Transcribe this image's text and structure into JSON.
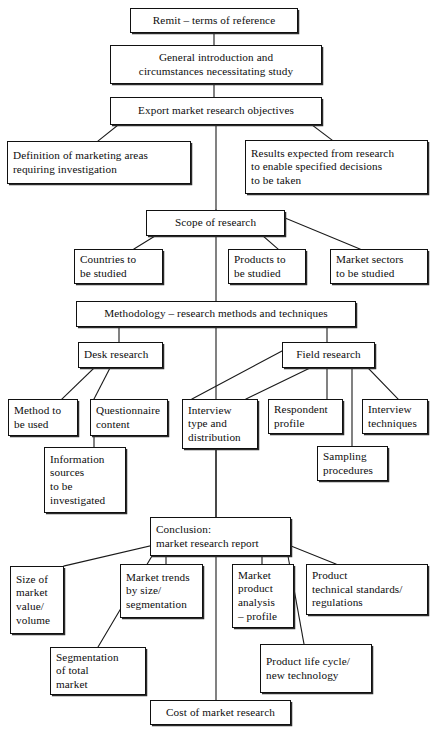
{
  "diagram": {
    "type": "flowchart",
    "orientation": "top-down",
    "line_color": "#111111",
    "box_fill": "#ffffff",
    "nodes": [
      {
        "id": "remit",
        "label": "Remit – terms of reference",
        "x": 130,
        "y": 8,
        "w": 168,
        "h": 25,
        "align": "center"
      },
      {
        "id": "general",
        "label": "General introduction and\ncircumstances necessitating study",
        "x": 110,
        "y": 45,
        "w": 212,
        "h": 39,
        "align": "center"
      },
      {
        "id": "export",
        "label": "Export market research objectives",
        "x": 110,
        "y": 97,
        "w": 212,
        "h": 28,
        "align": "center"
      },
      {
        "id": "definition",
        "label": "Definition of marketing areas\nrequiring investigation",
        "x": 7,
        "y": 141,
        "w": 184,
        "h": 43,
        "align": "left"
      },
      {
        "id": "results",
        "label": "Results expected from research\nto enable specified decisions\nto be taken",
        "x": 245,
        "y": 140,
        "w": 183,
        "h": 54,
        "align": "left"
      },
      {
        "id": "scope",
        "label": "Scope of research",
        "x": 146,
        "y": 210,
        "w": 139,
        "h": 26,
        "align": "center"
      },
      {
        "id": "countries",
        "label": "Countries to\nbe studied",
        "x": 74,
        "y": 249,
        "w": 89,
        "h": 35,
        "align": "left"
      },
      {
        "id": "products",
        "label": "Products to\nbe studied",
        "x": 228,
        "y": 249,
        "w": 78,
        "h": 35,
        "align": "left"
      },
      {
        "id": "marketsectors",
        "label": "Market sectors\nto be studied",
        "x": 330,
        "y": 249,
        "w": 98,
        "h": 35,
        "align": "left"
      },
      {
        "id": "methodology",
        "label": "Methodology – research methods and techniques",
        "x": 76,
        "y": 301,
        "w": 280,
        "h": 26,
        "align": "center"
      },
      {
        "id": "desk",
        "label": "Desk research",
        "x": 78,
        "y": 342,
        "w": 85,
        "h": 26,
        "align": "left"
      },
      {
        "id": "field",
        "label": "Field research",
        "x": 282,
        "y": 342,
        "w": 93,
        "h": 26,
        "align": "center"
      },
      {
        "id": "method",
        "label": "Method to\nbe used",
        "x": 8,
        "y": 399,
        "w": 70,
        "h": 37,
        "align": "left"
      },
      {
        "id": "questionnaire",
        "label": "Questionnaire\ncontent",
        "x": 90,
        "y": 399,
        "w": 78,
        "h": 37,
        "align": "left"
      },
      {
        "id": "interviewtype",
        "label": "Interview\ntype and\ndistribution",
        "x": 182,
        "y": 399,
        "w": 76,
        "h": 50,
        "align": "left"
      },
      {
        "id": "respondent",
        "label": "Respondent\nprofile",
        "x": 268,
        "y": 399,
        "w": 75,
        "h": 35,
        "align": "left"
      },
      {
        "id": "interviewtech",
        "label": "Interview\ntechniques",
        "x": 362,
        "y": 399,
        "w": 66,
        "h": 35,
        "align": "left"
      },
      {
        "id": "information",
        "label": "Information\nsources\nto be\ninvestigated",
        "x": 44,
        "y": 447,
        "w": 82,
        "h": 66,
        "align": "left"
      },
      {
        "id": "sampling",
        "label": "Sampling\nprocedures",
        "x": 317,
        "y": 446,
        "w": 71,
        "h": 35,
        "align": "left"
      },
      {
        "id": "conclusion",
        "label": "Conclusion:\nmarket research report",
        "x": 150,
        "y": 517,
        "w": 141,
        "h": 39,
        "align": "left"
      },
      {
        "id": "sizeofmarket",
        "label": "Size of\nmarket\nvalue/\nvolume",
        "x": 10,
        "y": 566,
        "w": 54,
        "h": 68,
        "align": "left"
      },
      {
        "id": "markettrends",
        "label": "Market trends\nby size/\nsegmentation",
        "x": 120,
        "y": 564,
        "w": 83,
        "h": 54,
        "align": "left"
      },
      {
        "id": "marketproduct",
        "label": "Market\nproduct\nanalysis\n– profile",
        "x": 232,
        "y": 564,
        "w": 62,
        "h": 64,
        "align": "left"
      },
      {
        "id": "producttech",
        "label": "Product\ntechnical standards/\nregulations",
        "x": 306,
        "y": 564,
        "w": 122,
        "h": 51,
        "align": "left"
      },
      {
        "id": "segmentation",
        "label": "Segmentation\nof total\nmarket",
        "x": 50,
        "y": 647,
        "w": 96,
        "h": 48,
        "align": "left"
      },
      {
        "id": "productlife",
        "label": "Product life cycle/\nnew technology",
        "x": 260,
        "y": 644,
        "w": 112,
        "h": 49,
        "align": "left"
      },
      {
        "id": "cost",
        "label": "Cost of market research",
        "x": 150,
        "y": 700,
        "w": 141,
        "h": 25,
        "align": "center"
      }
    ],
    "connectors": [
      {
        "from": "remit",
        "to": "general",
        "path": "M 214 33 L 214 45"
      },
      {
        "from": "general",
        "to": "export",
        "path": "M 214 84 L 214 97"
      },
      {
        "from": "export",
        "to": "definition",
        "path": "M 118 125 L 98 141"
      },
      {
        "from": "export",
        "to": "results",
        "path": "M 312 125 L 332 140"
      },
      {
        "from": "export",
        "to": "spine",
        "path": "M 216 125 L 216 211"
      },
      {
        "from": "spine",
        "to": "scope",
        "path": "M 216 211 L 216 210"
      },
      {
        "from": "scope",
        "to": "countries",
        "path": "M 155 236 L 134 249"
      },
      {
        "from": "scope",
        "to": "products",
        "path": "M 263 236 L 278 249"
      },
      {
        "from": "scope",
        "to": "marketsectors",
        "path": "M 285 218 L 360 249"
      },
      {
        "from": "scope",
        "to": "methodology",
        "path": "M 216 236 L 216 301"
      },
      {
        "from": "methodology",
        "to": "desk",
        "path": "M 119 327 L 119 342"
      },
      {
        "from": "methodology",
        "to": "field",
        "path": "M 327 327 L 327 342"
      },
      {
        "from": "methodology",
        "to": "spine",
        "path": "M 216 327 L 216 518"
      },
      {
        "from": "desk",
        "to": "method",
        "path": "M 94 368 L 62 399"
      },
      {
        "from": "desk",
        "to": "questionnaire",
        "path": "M 110 368 L 94 399"
      },
      {
        "from": "questionnaire",
        "to": "information",
        "path": "M 94 436 L 94 447"
      },
      {
        "from": "field",
        "to": "interviewtype",
        "path": "M 282 351 L 192 399"
      },
      {
        "from": "field",
        "to": "interviewtype2",
        "path": "M 310 368 L 246 399"
      },
      {
        "from": "field",
        "to": "respondent",
        "path": "M 327 368 L 327 399"
      },
      {
        "from": "field",
        "to": "interviewtech",
        "path": "M 368 368 L 398 399"
      },
      {
        "from": "field",
        "to": "sampling",
        "path": "M 352 368 L 352 446"
      },
      {
        "from": "interviewtype",
        "to": "conclusion",
        "path": "M 216 449 L 216 517"
      },
      {
        "from": "conclusion",
        "to": "sizeofmarket",
        "path": "M 150 546 L 64 566"
      },
      {
        "from": "conclusion",
        "to": "segmentation",
        "path": "M 152 556 L 98 647"
      },
      {
        "from": "conclusion",
        "to": "markettrends",
        "path": "M 166 556 L 166 564"
      },
      {
        "from": "conclusion",
        "to": "marketproduct",
        "path": "M 262 556 L 262 564"
      },
      {
        "from": "conclusion",
        "to": "producttech",
        "path": "M 291 546 L 336 564"
      },
      {
        "from": "conclusion",
        "to": "productlife",
        "path": "M 288 556 L 304 644"
      },
      {
        "from": "conclusion",
        "to": "cost",
        "path": "M 216 556 L 216 700"
      }
    ]
  }
}
